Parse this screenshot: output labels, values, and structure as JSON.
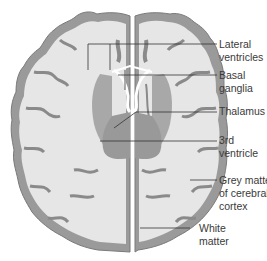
{
  "diagram": {
    "type": "anatomical-cross-section",
    "colors": {
      "background": "#ffffff",
      "white_matter": "#e6e6e6",
      "grey_matter": "#9a9a9a",
      "grey_matter_outline": "#7a7a7a",
      "deep_grey": "#a8a8a8",
      "ventricle": "#ffffff",
      "leader_line": "#333333",
      "label_text": "#3a3a3a"
    },
    "labels": [
      {
        "id": "lateral-ventricles",
        "lines": [
          "Lateral",
          "ventricles"
        ]
      },
      {
        "id": "basal-ganglia",
        "lines": [
          "Basal",
          "ganglia"
        ]
      },
      {
        "id": "thalamus",
        "lines": [
          "Thalamus"
        ]
      },
      {
        "id": "third-ventricle",
        "lines": [
          "3rd",
          "ventricle"
        ]
      },
      {
        "id": "grey-matter",
        "lines": [
          "Grey matter",
          "of cerebral",
          "cortex"
        ]
      },
      {
        "id": "white-matter",
        "lines": [
          "White",
          "matter"
        ]
      }
    ]
  }
}
